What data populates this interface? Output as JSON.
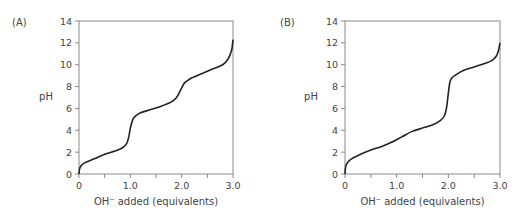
{
  "chart_data": [
    {
      "type": "line",
      "panel_label": "(A)",
      "title": "",
      "xlabel": "OH⁻ added (equivalents)",
      "ylabel": "pH",
      "xlim": [
        0,
        3.0
      ],
      "ylim": [
        0,
        14
      ],
      "x_ticks": [
        "0",
        "1.0",
        "2.0",
        "3.0"
      ],
      "y_ticks": [
        "0",
        "2",
        "4",
        "6",
        "8",
        "10",
        "12",
        "14"
      ],
      "grid": false,
      "legend": null,
      "series": [
        {
          "name": "titration curve A",
          "x": [
            0,
            0.02,
            0.1,
            0.3,
            0.5,
            0.7,
            0.85,
            0.93,
            0.97,
            1.0,
            1.05,
            1.1,
            1.2,
            1.4,
            1.6,
            1.8,
            1.9,
            1.97,
            2.05,
            2.1,
            2.2,
            2.4,
            2.6,
            2.8,
            2.9,
            2.95,
            2.98,
            3.0
          ],
          "y": [
            0,
            0.6,
            1.0,
            1.4,
            1.8,
            2.1,
            2.4,
            2.8,
            3.4,
            4.2,
            5.0,
            5.3,
            5.6,
            5.9,
            6.2,
            6.6,
            7.0,
            7.6,
            8.3,
            8.5,
            8.8,
            9.2,
            9.6,
            10.0,
            10.5,
            11.0,
            11.5,
            12.3
          ]
        }
      ]
    },
    {
      "type": "line",
      "panel_label": "(B)",
      "title": "",
      "xlabel": "OH⁻ added (equivalents)",
      "ylabel": "pH",
      "xlim": [
        0,
        3.0
      ],
      "ylim": [
        0,
        14
      ],
      "x_ticks": [
        "0",
        "1.0",
        "2.0",
        "3.0"
      ],
      "y_ticks": [
        "0",
        "2",
        "4",
        "6",
        "8",
        "10",
        "12",
        "14"
      ],
      "grid": false,
      "legend": null,
      "series": [
        {
          "name": "titration curve B",
          "x": [
            0,
            0.02,
            0.1,
            0.3,
            0.5,
            0.7,
            0.9,
            1.1,
            1.3,
            1.5,
            1.7,
            1.85,
            1.93,
            1.97,
            2.0,
            2.03,
            2.07,
            2.15,
            2.3,
            2.5,
            2.7,
            2.85,
            2.93,
            2.97,
            3.0
          ],
          "y": [
            0,
            0.8,
            1.3,
            1.8,
            2.2,
            2.5,
            2.9,
            3.4,
            3.9,
            4.2,
            4.5,
            4.9,
            5.4,
            6.2,
            7.4,
            8.4,
            8.8,
            9.1,
            9.5,
            9.8,
            10.1,
            10.4,
            10.8,
            11.3,
            12.0
          ]
        }
      ]
    }
  ]
}
